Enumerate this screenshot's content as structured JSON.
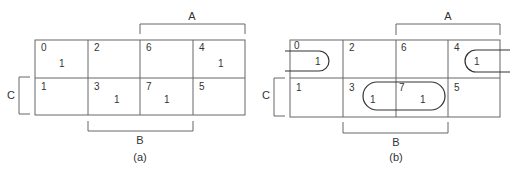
{
  "maps": [
    {
      "caption": "(a)",
      "labels": {
        "A": "A",
        "B": "B",
        "C": "C"
      },
      "cells": [
        {
          "index": "0",
          "value": "1"
        },
        {
          "index": "2",
          "value": ""
        },
        {
          "index": "6",
          "value": ""
        },
        {
          "index": "4",
          "value": "1"
        },
        {
          "index": "1",
          "value": ""
        },
        {
          "index": "3",
          "value": "1"
        },
        {
          "index": "7",
          "value": "1"
        },
        {
          "index": "5",
          "value": ""
        }
      ]
    },
    {
      "caption": "(b)",
      "labels": {
        "A": "A",
        "B": "B",
        "C": "C"
      },
      "cells": [
        {
          "index": "0",
          "value": "1"
        },
        {
          "index": "2",
          "value": ""
        },
        {
          "index": "6",
          "value": ""
        },
        {
          "index": "4",
          "value": "1"
        },
        {
          "index": "1",
          "value": ""
        },
        {
          "index": "3",
          "value": "1"
        },
        {
          "index": "7",
          "value": "1"
        },
        {
          "index": "5",
          "value": ""
        }
      ],
      "groupings": [
        "wrap-around cells 0 and 4",
        "cells 3 and 7"
      ]
    }
  ]
}
